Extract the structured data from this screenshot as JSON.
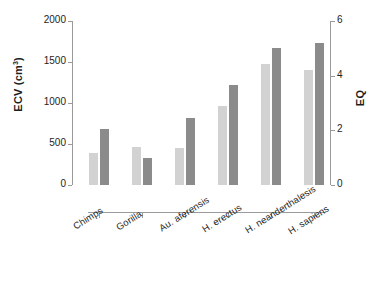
{
  "chart_data": {
    "type": "bar",
    "title": "",
    "subtitle": "",
    "xlabel": "",
    "ylabel": "ECV (cm3)",
    "ylabel_html": "ECV (cm<sup>3</sup>)",
    "y2label": "EQ",
    "categories": [
      "Chimps",
      "Gorilla",
      "Au. aferensis",
      "H. erectus",
      "H. neanderthalesis",
      "H. sapiens"
    ],
    "series": [
      {
        "name": "ECV (cm3)",
        "axis": "left",
        "color": "#d2d2d2",
        "values": [
          390,
          460,
          450,
          960,
          1480,
          1400
        ]
      },
      {
        "name": "EQ",
        "axis": "right",
        "color": "#8b8b8b",
        "values": [
          2.05,
          1.0,
          2.45,
          3.65,
          5.0,
          5.2
        ]
      }
    ],
    "ylim": [
      0,
      2000
    ],
    "y2lim": [
      0,
      6
    ],
    "yticks": [
      "0",
      "500",
      "1000",
      "1500",
      "2000"
    ],
    "ytick_values": [
      0,
      500,
      1000,
      1500,
      2000
    ],
    "y2ticks": [
      "0",
      "2",
      "4",
      "6"
    ],
    "y2tick_values": [
      0,
      2,
      4,
      6
    ],
    "grid": false,
    "legend": "none",
    "bar_width_px": 9,
    "category_label_rotation_deg": -32
  },
  "axes": {
    "left_title": "ECV (cm",
    "left_title_sup": "3",
    "left_title_tail": ")",
    "right_title": "EQ"
  }
}
